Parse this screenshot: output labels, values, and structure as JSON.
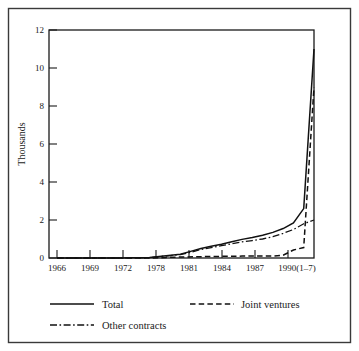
{
  "chart_data": {
    "type": "line",
    "title": "",
    "subtitle": "",
    "xlabel": "",
    "ylabel": "Thousands",
    "grid": false,
    "legend_position": "bottom",
    "xlim": [
      1966,
      1991
    ],
    "ylim": [
      0,
      12
    ],
    "yticks": [
      "0",
      "2",
      "4",
      "6",
      "8",
      "10",
      "12"
    ],
    "ytick_values": [
      0,
      2,
      4,
      6,
      8,
      10,
      12
    ],
    "categories": [
      "1966",
      "1969",
      "1972",
      "1978",
      "1981",
      "1984",
      "1987",
      "1990(1-7)"
    ],
    "xtick_labels": [
      "1966",
      "1969",
      "1972",
      "1978",
      "1981",
      "1984",
      "1987",
      "1990(1–7)"
    ],
    "xtick_values": [
      1966,
      1969,
      1972,
      1978,
      1981,
      1984,
      1987,
      1990
    ],
    "series": [
      {
        "name": "Total",
        "style": "solid",
        "x": [
          1966,
          1969,
          1972,
          1975,
          1978,
          1979,
          1980,
          1981,
          1982,
          1983,
          1984,
          1985,
          1986,
          1987,
          1988,
          1989,
          1990,
          1991
        ],
        "values": [
          0.0,
          0.0,
          0.0,
          0.02,
          0.2,
          0.35,
          0.5,
          0.62,
          0.72,
          0.85,
          0.98,
          1.08,
          1.2,
          1.35,
          1.55,
          1.85,
          2.6,
          11.0
        ]
      },
      {
        "name": "Joint ventures",
        "style": "dashed",
        "x": [
          1966,
          1969,
          1972,
          1975,
          1978,
          1981,
          1984,
          1987,
          1988,
          1989,
          1990,
          1991
        ],
        "values": [
          0.0,
          0.0,
          0.0,
          0.0,
          0.05,
          0.08,
          0.1,
          0.1,
          0.15,
          0.42,
          0.55,
          9.0
        ]
      },
      {
        "name": "Other contracts",
        "style": "dashdot",
        "x": [
          1966,
          1969,
          1972,
          1975,
          1978,
          1979,
          1980,
          1981,
          1982,
          1983,
          1984,
          1985,
          1986,
          1987,
          1988,
          1989,
          1990,
          1991
        ],
        "values": [
          0.0,
          0.0,
          0.0,
          0.02,
          0.18,
          0.3,
          0.45,
          0.55,
          0.65,
          0.75,
          0.85,
          0.92,
          1.0,
          1.12,
          1.3,
          1.5,
          1.8,
          2.0
        ]
      }
    ],
    "legend": [
      {
        "label": "Total",
        "style": "solid"
      },
      {
        "label": "Joint ventures",
        "style": "dashed"
      },
      {
        "label": "Other contracts",
        "style": "dashdot"
      }
    ],
    "colors": {
      "line": "#111111",
      "axis": "#1a1a1a",
      "frame": "#3a3a3a",
      "background": "#ffffff"
    }
  }
}
